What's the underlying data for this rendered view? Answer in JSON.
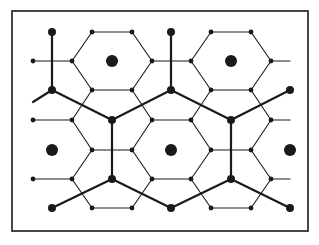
{
  "diagram": {
    "colors": {
      "stroke": "#1a1a1a",
      "background": "#ffffff",
      "frame": "#333333"
    },
    "frame": {
      "x": 12,
      "y": 11,
      "width": 296,
      "height": 220
    },
    "centers": [
      [
        112,
        61
      ],
      [
        231,
        61
      ],
      [
        52,
        150
      ],
      [
        171,
        150
      ],
      [
        290,
        150
      ]
    ],
    "thick_nodes": [
      [
        52,
        32
      ],
      [
        171,
        32
      ],
      [
        52,
        90
      ],
      [
        171,
        90
      ],
      [
        290,
        90
      ],
      [
        112,
        120
      ],
      [
        231,
        120
      ],
      [
        112,
        179
      ],
      [
        231,
        179
      ],
      [
        52,
        208
      ],
      [
        171,
        208
      ],
      [
        290,
        208
      ]
    ],
    "thick_edges": [
      [
        [
          52,
          32
        ],
        [
          52,
          90
        ]
      ],
      [
        [
          171,
          32
        ],
        [
          171,
          90
        ]
      ],
      [
        [
          33,
          102
        ],
        [
          52,
          90
        ]
      ],
      [
        [
          52,
          90
        ],
        [
          112,
          120
        ]
      ],
      [
        [
          171,
          90
        ],
        [
          112,
          120
        ]
      ],
      [
        [
          171,
          90
        ],
        [
          231,
          120
        ]
      ],
      [
        [
          290,
          90
        ],
        [
          231,
          120
        ]
      ],
      [
        [
          112,
          120
        ],
        [
          112,
          179
        ]
      ],
      [
        [
          231,
          120
        ],
        [
          231,
          179
        ]
      ],
      [
        [
          112,
          179
        ],
        [
          52,
          208
        ]
      ],
      [
        [
          112,
          179
        ],
        [
          171,
          208
        ]
      ],
      [
        [
          231,
          179
        ],
        [
          171,
          208
        ]
      ],
      [
        [
          231,
          179
        ],
        [
          290,
          208
        ]
      ]
    ],
    "small_nodes": [
      [
        92,
        32
      ],
      [
        132,
        32
      ],
      [
        211,
        32
      ],
      [
        251,
        32
      ],
      [
        33,
        61
      ],
      [
        72,
        61
      ],
      [
        152,
        61
      ],
      [
        191,
        61
      ],
      [
        271,
        61
      ],
      [
        92,
        90
      ],
      [
        132,
        90
      ],
      [
        211,
        90
      ],
      [
        251,
        90
      ],
      [
        33,
        120
      ],
      [
        72,
        120
      ],
      [
        152,
        120
      ],
      [
        191,
        120
      ],
      [
        271,
        120
      ],
      [
        92,
        150
      ],
      [
        132,
        150
      ],
      [
        211,
        150
      ],
      [
        251,
        150
      ],
      [
        33,
        179
      ],
      [
        72,
        179
      ],
      [
        152,
        179
      ],
      [
        191,
        179
      ],
      [
        271,
        179
      ],
      [
        92,
        208
      ],
      [
        132,
        208
      ],
      [
        211,
        208
      ],
      [
        251,
        208
      ]
    ],
    "thin_edges": [
      [
        [
          92,
          32
        ],
        [
          132,
          32
        ]
      ],
      [
        [
          211,
          32
        ],
        [
          251,
          32
        ]
      ],
      [
        [
          92,
          32
        ],
        [
          72,
          61
        ]
      ],
      [
        [
          132,
          32
        ],
        [
          152,
          61
        ]
      ],
      [
        [
          211,
          32
        ],
        [
          191,
          61
        ]
      ],
      [
        [
          251,
          32
        ],
        [
          271,
          61
        ]
      ],
      [
        [
          33,
          61
        ],
        [
          72,
          61
        ]
      ],
      [
        [
          152,
          61
        ],
        [
          191,
          61
        ]
      ],
      [
        [
          271,
          61
        ],
        [
          290,
          61
        ]
      ],
      [
        [
          72,
          61
        ],
        [
          92,
          90
        ]
      ],
      [
        [
          152,
          61
        ],
        [
          132,
          90
        ]
      ],
      [
        [
          191,
          61
        ],
        [
          211,
          90
        ]
      ],
      [
        [
          271,
          61
        ],
        [
          251,
          90
        ]
      ],
      [
        [
          92,
          90
        ],
        [
          132,
          90
        ]
      ],
      [
        [
          211,
          90
        ],
        [
          251,
          90
        ]
      ],
      [
        [
          92,
          90
        ],
        [
          72,
          120
        ]
      ],
      [
        [
          132,
          90
        ],
        [
          152,
          120
        ]
      ],
      [
        [
          211,
          90
        ],
        [
          191,
          120
        ]
      ],
      [
        [
          251,
          90
        ],
        [
          271,
          120
        ]
      ],
      [
        [
          33,
          120
        ],
        [
          72,
          120
        ]
      ],
      [
        [
          152,
          120
        ],
        [
          191,
          120
        ]
      ],
      [
        [
          271,
          120
        ],
        [
          290,
          120
        ]
      ],
      [
        [
          72,
          120
        ],
        [
          92,
          150
        ]
      ],
      [
        [
          152,
          120
        ],
        [
          132,
          150
        ]
      ],
      [
        [
          191,
          120
        ],
        [
          211,
          150
        ]
      ],
      [
        [
          271,
          120
        ],
        [
          251,
          150
        ]
      ],
      [
        [
          92,
          150
        ],
        [
          132,
          150
        ]
      ],
      [
        [
          211,
          150
        ],
        [
          251,
          150
        ]
      ],
      [
        [
          92,
          150
        ],
        [
          72,
          179
        ]
      ],
      [
        [
          132,
          150
        ],
        [
          152,
          179
        ]
      ],
      [
        [
          211,
          150
        ],
        [
          191,
          179
        ]
      ],
      [
        [
          251,
          150
        ],
        [
          271,
          179
        ]
      ],
      [
        [
          33,
          179
        ],
        [
          72,
          179
        ]
      ],
      [
        [
          152,
          179
        ],
        [
          191,
          179
        ]
      ],
      [
        [
          271,
          179
        ],
        [
          290,
          179
        ]
      ],
      [
        [
          72,
          179
        ],
        [
          92,
          208
        ]
      ],
      [
        [
          152,
          179
        ],
        [
          132,
          208
        ]
      ],
      [
        [
          191,
          179
        ],
        [
          211,
          208
        ]
      ],
      [
        [
          271,
          179
        ],
        [
          251,
          208
        ]
      ],
      [
        [
          92,
          208
        ],
        [
          132,
          208
        ]
      ],
      [
        [
          211,
          208
        ],
        [
          251,
          208
        ]
      ]
    ],
    "radii": {
      "center": 6,
      "thick_node": 4,
      "small_node": 2.4
    },
    "widths": {
      "thick": 2.2,
      "thin": 1.1,
      "frame": 1.8
    }
  }
}
